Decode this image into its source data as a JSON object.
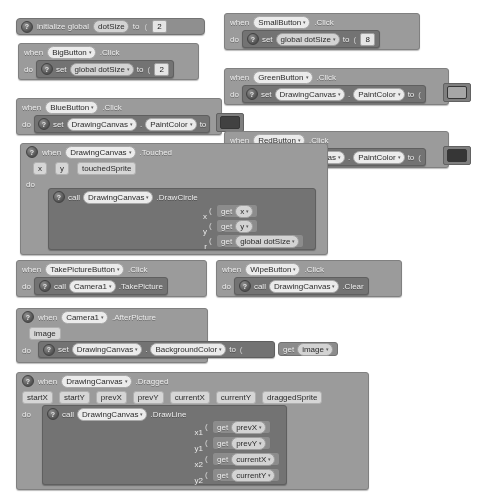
{
  "app": {
    "name": "MIT App Inventor Blocks Editor",
    "workspace_background": "#ffffff"
  },
  "colors": {
    "event_block": "#9a9a9a",
    "statement_block": "#6f6f6f",
    "value_block": "#8a8a8a",
    "global_block": "#8d8d8d",
    "paint_green_swatch": "#9d9d9d",
    "paint_blue_swatch": "#3a3a3a",
    "paint_red_swatch": "#2e2e2e"
  },
  "glyphs": {
    "gear": "?",
    "caret_down": "▾",
    "plug_left": "◖",
    "socket": "("
  },
  "keywords": {
    "when": "when",
    "do": "do",
    "set": "set",
    "call": "call",
    "to": "to",
    "get": "get",
    "initialize_global": "initialize global",
    "dot": "."
  },
  "blocks": [
    {
      "id": "init-global-dotsize",
      "kind": "global-declaration",
      "label": "initialize global",
      "variable": "dotSize",
      "to": "to",
      "value": "2"
    },
    {
      "id": "bigbutton-click",
      "kind": "event",
      "when": "when",
      "component": "BigButton",
      "event": ".Click",
      "do": "do",
      "body": {
        "action": "set",
        "target": "global dotSize",
        "to": "to",
        "value": "2"
      }
    },
    {
      "id": "smallbutton-click",
      "kind": "event",
      "when": "when",
      "component": "SmallButton",
      "event": ".Click",
      "do": "do",
      "body": {
        "action": "set",
        "target": "global dotSize",
        "to": "to",
        "value": "8"
      }
    },
    {
      "id": "greenbutton-click",
      "kind": "event",
      "when": "when",
      "component": "GreenButton",
      "event": ".Click",
      "do": "do",
      "body": {
        "action": "set",
        "object": "DrawingCanvas",
        "property": "PaintColor",
        "to": "to",
        "value_kind": "color-swatch",
        "value_color": "#9d9d9d"
      }
    },
    {
      "id": "bluebutton-click",
      "kind": "event",
      "when": "when",
      "component": "BlueButton",
      "event": ".Click",
      "do": "do",
      "body": {
        "action": "set",
        "object": "DrawingCanvas",
        "property": "PaintColor",
        "to": "to",
        "value_kind": "color-swatch",
        "value_color": "#3a3a3a"
      }
    },
    {
      "id": "redbutton-click",
      "kind": "event",
      "when": "when",
      "component": "RedButton",
      "event": ".Click",
      "do": "do",
      "body": {
        "action": "set",
        "object": "DrawingCanvas",
        "property": "PaintColor",
        "to": "to",
        "value_kind": "color-swatch",
        "value_color": "#2e2e2e"
      }
    },
    {
      "id": "drawingcanvas-touched",
      "kind": "event",
      "when": "when",
      "component": "DrawingCanvas",
      "event": ".Touched",
      "params": [
        "x",
        "y",
        "touchedSprite"
      ],
      "do": "do",
      "body": {
        "action": "call",
        "object": "DrawingCanvas",
        "method": ".DrawCircle",
        "args": [
          {
            "name": "x",
            "get": "get",
            "value": "x"
          },
          {
            "name": "y",
            "get": "get",
            "value": "y"
          },
          {
            "name": "r",
            "get": "get",
            "value": "global dotSize"
          }
        ]
      }
    },
    {
      "id": "takepicturebutton-click",
      "kind": "event",
      "when": "when",
      "component": "TakePictureButton",
      "event": ".Click",
      "do": "do",
      "body": {
        "action": "call",
        "object": "Camera1",
        "method": ".TakePicture"
      }
    },
    {
      "id": "wipebutton-click",
      "kind": "event",
      "when": "when",
      "component": "WipeButton",
      "event": ".Click",
      "do": "do",
      "body": {
        "action": "call",
        "object": "DrawingCanvas",
        "method": ".Clear"
      }
    },
    {
      "id": "camera1-afterpicture",
      "kind": "event",
      "when": "when",
      "component": "Camera1",
      "event": ".AfterPicture",
      "params": [
        "image"
      ],
      "do": "do",
      "body": {
        "action": "set",
        "object": "DrawingCanvas",
        "property": "BackgroundColor",
        "to": "to",
        "get": "get",
        "value": "image"
      }
    },
    {
      "id": "drawingcanvas-dragged",
      "kind": "event",
      "when": "when",
      "component": "DrawingCanvas",
      "event": ".Dragged",
      "params": [
        "startX",
        "startY",
        "prevX",
        "prevY",
        "currentX",
        "currentY",
        "draggedSprite"
      ],
      "do": "do",
      "body": {
        "action": "call",
        "object": "DrawingCanvas",
        "method": ".DrawLine",
        "args": [
          {
            "name": "x1",
            "get": "get",
            "value": "prevX"
          },
          {
            "name": "y1",
            "get": "get",
            "value": "prevY"
          },
          {
            "name": "x2",
            "get": "get",
            "value": "currentX"
          },
          {
            "name": "y2",
            "get": "get",
            "value": "currentY"
          }
        ]
      }
    }
  ]
}
